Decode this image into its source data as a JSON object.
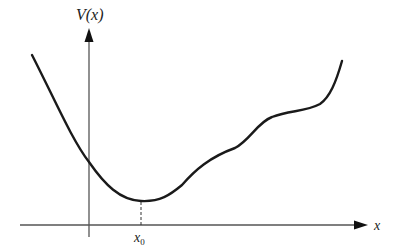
{
  "figure": {
    "y_axis_label": "V(x)",
    "x_axis_label": "x",
    "min_label_base": "x",
    "min_label_sub": "0",
    "curve_color": "#1a1a1a",
    "axis_color": "#555555"
  }
}
